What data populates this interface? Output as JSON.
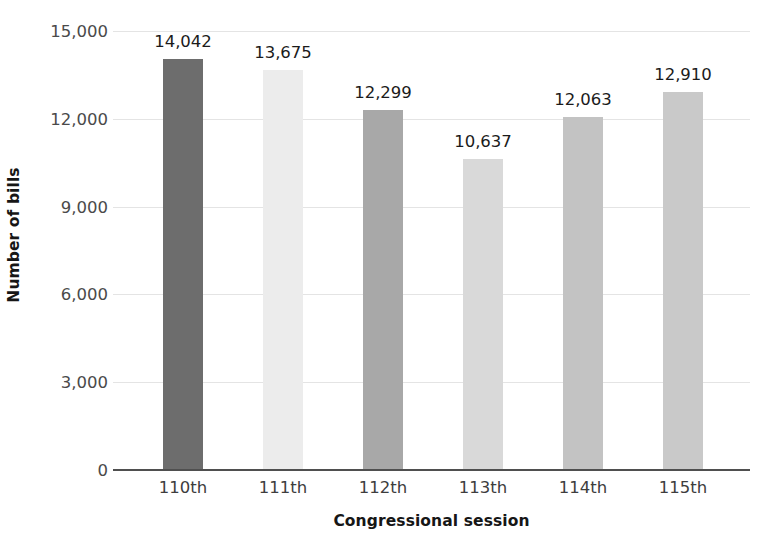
{
  "chart_data": {
    "type": "bar",
    "title": "",
    "subtitle": "",
    "xlabel": "Congressional session",
    "ylabel": "Number of bills",
    "categories": [
      "110th",
      "111th",
      "112th",
      "113th",
      "114th",
      "115th"
    ],
    "values": [
      14042,
      13675,
      12299,
      10637,
      12063,
      12910
    ],
    "value_labels": [
      "14,042",
      "13,675",
      "12,299",
      "10,637",
      "12,063",
      "12,910"
    ],
    "series": [
      {
        "name": "Number of bills",
        "values": [
          14042,
          13675,
          12299,
          10637,
          12063,
          12910
        ]
      }
    ],
    "bar_colors": [
      "#6d6d6d",
      "#ececec",
      "#a8a8a8",
      "#d9d9d9",
      "#c3c3c3",
      "#c9c9c9"
    ],
    "ylim": [
      0,
      15000
    ],
    "yticks": [
      0,
      3000,
      6000,
      9000,
      12000,
      15000
    ],
    "ytick_labels": [
      "0",
      "3,000",
      "6,000",
      "9,000",
      "12,000",
      "15,000"
    ],
    "grid": true,
    "grid_axis": "y",
    "legend": false,
    "legend_position": "none",
    "background_color": "#ffffff",
    "gridline_color": "#e4e4e4",
    "axis_color": "#4f4f4f",
    "text_color": "#1b1b1b"
  }
}
